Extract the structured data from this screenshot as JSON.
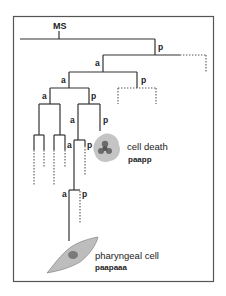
{
  "diagram": {
    "root_label": "MS",
    "branch_labels": {
      "l1_p": "p",
      "l2_a": "a",
      "l3_a": "a",
      "l3_p": "p",
      "l4_a": "a",
      "l4_p": "p",
      "l5_a": "a",
      "l5_p": "p",
      "l6_a": "a",
      "l6_p": "p",
      "l7_a": "a",
      "l7_p": "p"
    },
    "fates": [
      {
        "name": "cell death",
        "lineage": "paapp"
      },
      {
        "name": "pharyngeal cell",
        "lineage": "paapaaa"
      }
    ],
    "colors": {
      "line": "#333333",
      "cell_fill": "#bdbdbd",
      "cell_dark": "#6b6b6b"
    }
  }
}
